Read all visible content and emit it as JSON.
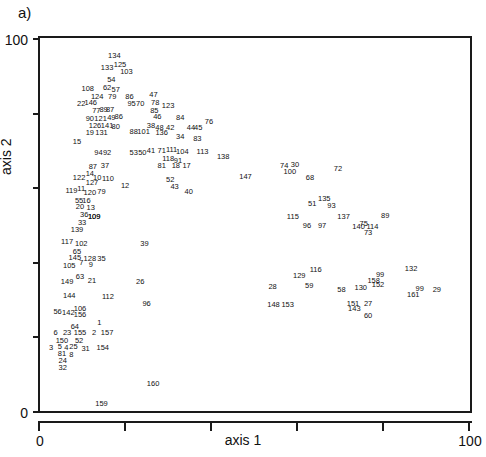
{
  "panel": {
    "label": "a)"
  },
  "chart_data": {
    "type": "scatter",
    "title": "",
    "subtitle": "",
    "xlabel": "axis 1",
    "ylabel": "axis 2",
    "xlim": [
      0,
      100
    ],
    "ylim": [
      0,
      100
    ],
    "xticks": [
      0,
      20,
      40,
      60,
      80,
      100
    ],
    "xtick_labels": [
      "0",
      "",
      "",
      "",
      "",
      "100"
    ],
    "yticks": [
      0,
      20,
      40,
      60,
      80,
      100
    ],
    "ytick_labels": [
      "0",
      "",
      "",
      "",
      "",
      "100"
    ],
    "grid": false,
    "legend": null,
    "marker_style": "text-label-only",
    "note": "Each data point is rendered as its numeric sample id rather than a marker glyph.",
    "points": [
      {
        "label": "134",
        "x": 17.3,
        "y": 95.2
      },
      {
        "label": "133",
        "x": 15.6,
        "y": 92.0
      },
      {
        "label": "125",
        "x": 18.6,
        "y": 92.8
      },
      {
        "label": "103",
        "x": 20.1,
        "y": 91.0
      },
      {
        "label": "54",
        "x": 16.6,
        "y": 88.8
      },
      {
        "label": "62",
        "x": 15.6,
        "y": 86.6
      },
      {
        "label": "57",
        "x": 17.6,
        "y": 86.0
      },
      {
        "label": "108",
        "x": 11.1,
        "y": 86.3
      },
      {
        "label": "124",
        "x": 13.3,
        "y": 84.1
      },
      {
        "label": "79",
        "x": 16.8,
        "y": 84.1
      },
      {
        "label": "86",
        "x": 20.8,
        "y": 84.1
      },
      {
        "label": "47",
        "x": 26.4,
        "y": 84.6
      },
      {
        "label": "22",
        "x": 9.6,
        "y": 82.2
      },
      {
        "label": "146",
        "x": 11.8,
        "y": 82.5
      },
      {
        "label": "95",
        "x": 21.3,
        "y": 82.2
      },
      {
        "label": "70",
        "x": 23.3,
        "y": 82.2
      },
      {
        "label": "78",
        "x": 26.8,
        "y": 82.6
      },
      {
        "label": "123",
        "x": 29.8,
        "y": 81.8
      },
      {
        "label": "77",
        "x": 13.1,
        "y": 80.4
      },
      {
        "label": "89",
        "x": 14.8,
        "y": 80.6
      },
      {
        "label": "87",
        "x": 16.3,
        "y": 80.6
      },
      {
        "label": "85",
        "x": 26.6,
        "y": 80.4
      },
      {
        "label": "90",
        "x": 11.6,
        "y": 78.4
      },
      {
        "label": "121",
        "x": 14.1,
        "y": 78.4
      },
      {
        "label": "49",
        "x": 16.6,
        "y": 78.6
      },
      {
        "label": "86",
        "x": 18.3,
        "y": 78.8
      },
      {
        "label": "46",
        "x": 27.3,
        "y": 78.8
      },
      {
        "label": "84",
        "x": 32.6,
        "y": 78.6
      },
      {
        "label": "126",
        "x": 12.8,
        "y": 76.4
      },
      {
        "label": "141",
        "x": 15.6,
        "y": 76.4
      },
      {
        "label": "80",
        "x": 17.6,
        "y": 76.2
      },
      {
        "label": "38",
        "x": 25.8,
        "y": 76.4
      },
      {
        "label": "48",
        "x": 27.8,
        "y": 75.8
      },
      {
        "label": "42",
        "x": 30.3,
        "y": 76.0
      },
      {
        "label": "44",
        "x": 35.1,
        "y": 75.8
      },
      {
        "label": "45",
        "x": 36.8,
        "y": 75.8
      },
      {
        "label": "76",
        "x": 39.3,
        "y": 77.6
      },
      {
        "label": "19",
        "x": 11.6,
        "y": 74.4
      },
      {
        "label": "131",
        "x": 14.3,
        "y": 74.4
      },
      {
        "label": "88",
        "x": 21.8,
        "y": 74.8
      },
      {
        "label": "101",
        "x": 24.1,
        "y": 74.8
      },
      {
        "label": "136",
        "x": 28.3,
        "y": 74.6
      },
      {
        "label": "34",
        "x": 32.6,
        "y": 73.4
      },
      {
        "label": "83",
        "x": 36.6,
        "y": 72.8
      },
      {
        "label": "15",
        "x": 8.6,
        "y": 72.0
      },
      {
        "label": "94",
        "x": 13.6,
        "y": 69.2
      },
      {
        "label": "92",
        "x": 15.6,
        "y": 69.2
      },
      {
        "label": "53",
        "x": 21.8,
        "y": 69.2
      },
      {
        "label": "50",
        "x": 23.8,
        "y": 69.2
      },
      {
        "label": "41",
        "x": 25.8,
        "y": 69.6
      },
      {
        "label": "71",
        "x": 28.3,
        "y": 69.6
      },
      {
        "label": "111",
        "x": 30.6,
        "y": 70.0
      },
      {
        "label": "104",
        "x": 33.1,
        "y": 69.4
      },
      {
        "label": "113",
        "x": 37.8,
        "y": 69.4
      },
      {
        "label": "138",
        "x": 42.6,
        "y": 68.0
      },
      {
        "label": "118",
        "x": 29.8,
        "y": 67.6
      },
      {
        "label": "91",
        "x": 32.1,
        "y": 67.0
      },
      {
        "label": "81",
        "x": 28.3,
        "y": 65.8
      },
      {
        "label": "18",
        "x": 31.6,
        "y": 65.6
      },
      {
        "label": "17",
        "x": 34.1,
        "y": 65.6
      },
      {
        "label": "87",
        "x": 12.3,
        "y": 65.4
      },
      {
        "label": "37",
        "x": 15.1,
        "y": 65.6
      },
      {
        "label": "14",
        "x": 11.6,
        "y": 63.6
      },
      {
        "label": "122",
        "x": 9.1,
        "y": 62.6
      },
      {
        "label": "10",
        "x": 13.3,
        "y": 62.6
      },
      {
        "label": "110",
        "x": 15.8,
        "y": 62.2
      },
      {
        "label": "127",
        "x": 12.1,
        "y": 61.0
      },
      {
        "label": "52",
        "x": 30.3,
        "y": 62.0
      },
      {
        "label": "12",
        "x": 19.8,
        "y": 60.2
      },
      {
        "label": "43",
        "x": 31.3,
        "y": 60.0
      },
      {
        "label": "40",
        "x": 34.6,
        "y": 58.8
      },
      {
        "label": "11",
        "x": 9.6,
        "y": 59.6
      },
      {
        "label": "119",
        "x": 7.3,
        "y": 59.0
      },
      {
        "label": "120",
        "x": 11.6,
        "y": 58.4
      },
      {
        "label": "79",
        "x": 14.3,
        "y": 58.8
      },
      {
        "label": "55",
        "x": 9.1,
        "y": 56.2
      },
      {
        "label": "16",
        "x": 10.8,
        "y": 56.4
      },
      {
        "label": "20",
        "x": 9.3,
        "y": 54.6
      },
      {
        "label": "13",
        "x": 11.8,
        "y": 54.4
      },
      {
        "label": "36",
        "x": 10.3,
        "y": 52.6
      },
      {
        "label": "109",
        "x": 12.6,
        "y": 52.0
      },
      {
        "label": "33",
        "x": 9.8,
        "y": 50.4
      },
      {
        "label": "139",
        "x": 8.6,
        "y": 48.4
      },
      {
        "label": "147",
        "x": 47.8,
        "y": 62.8
      },
      {
        "label": "74",
        "x": 56.8,
        "y": 65.6
      },
      {
        "label": "30",
        "x": 59.3,
        "y": 66.0
      },
      {
        "label": "100",
        "x": 58.1,
        "y": 64.0
      },
      {
        "label": "72",
        "x": 69.3,
        "y": 65.0
      },
      {
        "label": "68",
        "x": 62.8,
        "y": 62.6
      },
      {
        "label": "135",
        "x": 66.1,
        "y": 56.8
      },
      {
        "label": "51",
        "x": 63.3,
        "y": 55.6
      },
      {
        "label": "93",
        "x": 67.8,
        "y": 55.0
      },
      {
        "label": "117",
        "x": 6.3,
        "y": 45.2
      },
      {
        "label": "102",
        "x": 9.6,
        "y": 44.8
      },
      {
        "label": "65",
        "x": 8.6,
        "y": 42.6
      },
      {
        "label": "115",
        "x": 58.8,
        "y": 52.0
      },
      {
        "label": "137",
        "x": 70.6,
        "y": 52.0
      },
      {
        "label": "89",
        "x": 80.3,
        "y": 52.2
      },
      {
        "label": "75",
        "x": 75.3,
        "y": 50.2
      },
      {
        "label": "96",
        "x": 62.1,
        "y": 49.6
      },
      {
        "label": "97",
        "x": 65.6,
        "y": 49.6
      },
      {
        "label": "140",
        "x": 74.1,
        "y": 49.2
      },
      {
        "label": "114",
        "x": 77.3,
        "y": 49.2
      },
      {
        "label": "73",
        "x": 76.3,
        "y": 47.8
      },
      {
        "label": "145",
        "x": 8.1,
        "y": 41.0
      },
      {
        "label": "128",
        "x": 11.6,
        "y": 40.8
      },
      {
        "label": "35",
        "x": 14.3,
        "y": 40.8
      },
      {
        "label": "7",
        "x": 9.6,
        "y": 39.6
      },
      {
        "label": "9",
        "x": 11.8,
        "y": 39.2
      },
      {
        "label": "105",
        "x": 6.8,
        "y": 38.8
      },
      {
        "label": "63",
        "x": 9.3,
        "y": 35.8
      },
      {
        "label": "21",
        "x": 12.1,
        "y": 34.8
      },
      {
        "label": "149",
        "x": 6.3,
        "y": 34.6
      },
      {
        "label": "26",
        "x": 23.3,
        "y": 34.6
      },
      {
        "label": "116",
        "x": 64.1,
        "y": 37.8
      },
      {
        "label": "129",
        "x": 60.3,
        "y": 36.2
      },
      {
        "label": "99",
        "x": 79.1,
        "y": 36.4
      },
      {
        "label": "132",
        "x": 86.3,
        "y": 38.0
      },
      {
        "label": "158",
        "x": 77.6,
        "y": 34.8
      },
      {
        "label": "152",
        "x": 78.6,
        "y": 33.8
      },
      {
        "label": "59",
        "x": 62.6,
        "y": 33.4
      },
      {
        "label": "58",
        "x": 70.1,
        "y": 32.4
      },
      {
        "label": "130",
        "x": 74.6,
        "y": 33.0
      },
      {
        "label": "99",
        "x": 88.3,
        "y": 32.8
      },
      {
        "label": "29",
        "x": 92.3,
        "y": 32.4
      },
      {
        "label": "161",
        "x": 86.8,
        "y": 31.2
      },
      {
        "label": "28",
        "x": 54.1,
        "y": 33.2
      },
      {
        "label": "144",
        "x": 6.8,
        "y": 30.8
      },
      {
        "label": "112",
        "x": 15.8,
        "y": 30.6
      },
      {
        "label": "96",
        "x": 24.8,
        "y": 28.6
      },
      {
        "label": "148",
        "x": 54.3,
        "y": 28.4
      },
      {
        "label": "153",
        "x": 57.6,
        "y": 28.4
      },
      {
        "label": "151",
        "x": 72.8,
        "y": 28.8
      },
      {
        "label": "27",
        "x": 76.3,
        "y": 28.8
      },
      {
        "label": "143",
        "x": 73.1,
        "y": 27.4
      },
      {
        "label": "60",
        "x": 76.3,
        "y": 25.6
      },
      {
        "label": "56",
        "x": 4.1,
        "y": 26.6
      },
      {
        "label": "142",
        "x": 6.6,
        "y": 26.4
      },
      {
        "label": "106",
        "x": 9.3,
        "y": 27.4
      },
      {
        "label": "156",
        "x": 9.3,
        "y": 25.8
      },
      {
        "label": "1",
        "x": 13.8,
        "y": 23.6
      },
      {
        "label": "64",
        "x": 8.1,
        "y": 22.4
      },
      {
        "label": "6",
        "x": 3.6,
        "y": 20.8
      },
      {
        "label": "23",
        "x": 6.3,
        "y": 20.8
      },
      {
        "label": "155",
        "x": 9.3,
        "y": 20.8
      },
      {
        "label": "2",
        "x": 12.6,
        "y": 20.8
      },
      {
        "label": "157",
        "x": 15.6,
        "y": 20.8
      },
      {
        "label": "150",
        "x": 5.1,
        "y": 18.8
      },
      {
        "label": "52",
        "x": 9.1,
        "y": 18.8
      },
      {
        "label": "3",
        "x": 2.6,
        "y": 17.0
      },
      {
        "label": "5",
        "x": 4.6,
        "y": 17.2
      },
      {
        "label": "4",
        "x": 6.1,
        "y": 16.8
      },
      {
        "label": "25",
        "x": 7.8,
        "y": 17.2
      },
      {
        "label": "31",
        "x": 10.6,
        "y": 16.6
      },
      {
        "label": "154",
        "x": 14.6,
        "y": 17.0
      },
      {
        "label": "81",
        "x": 5.1,
        "y": 15.4
      },
      {
        "label": "8",
        "x": 7.3,
        "y": 15.0
      },
      {
        "label": "24",
        "x": 5.3,
        "y": 13.4
      },
      {
        "label": "32",
        "x": 5.3,
        "y": 11.6
      },
      {
        "label": "160",
        "x": 26.3,
        "y": 7.2
      },
      {
        "label": "159",
        "x": 14.3,
        "y": 1.8
      },
      {
        "label": "39",
        "x": 24.3,
        "y": 44.8
      },
      {
        "label": "109",
        "x": 12.6,
        "y": 52.0
      }
    ]
  }
}
